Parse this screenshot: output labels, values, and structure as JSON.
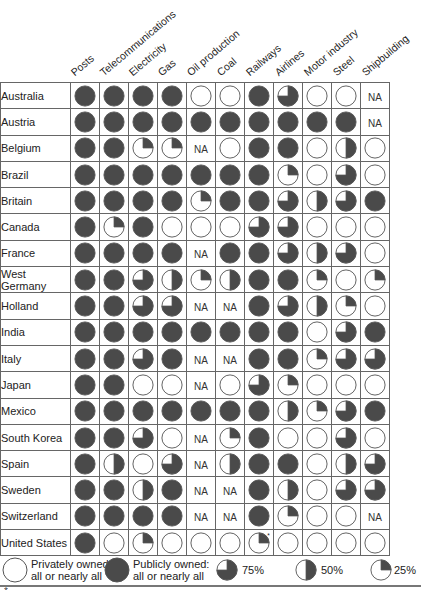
{
  "chart_data": {
    "type": "table",
    "title": "",
    "columns": [
      "Posts",
      "Telecommunications",
      "Electricity",
      "Gas",
      "Oil production",
      "Coal",
      "Railways",
      "Airlines",
      "Motor industry",
      "Steel",
      "Shipbuilding"
    ],
    "value_legend": {
      "0": "Privately owned: all or nearly all",
      "25": "25%",
      "50": "50%",
      "75": "75%",
      "100": "Publicly owned: all or nearly all",
      "NA": "NA"
    },
    "rows": [
      {
        "country": "Australia",
        "values": [
          100,
          100,
          100,
          100,
          0,
          0,
          100,
          75,
          0,
          0,
          "NA"
        ]
      },
      {
        "country": "Austria",
        "values": [
          100,
          100,
          100,
          100,
          100,
          100,
          100,
          100,
          100,
          100,
          "NA"
        ]
      },
      {
        "country": "Belgium",
        "values": [
          100,
          100,
          25,
          25,
          "NA",
          0,
          100,
          100,
          0,
          50,
          0
        ]
      },
      {
        "country": "Brazil",
        "values": [
          100,
          100,
          100,
          100,
          100,
          100,
          100,
          25,
          0,
          75,
          0
        ]
      },
      {
        "country": "Britain",
        "values": [
          100,
          100,
          100,
          100,
          25,
          100,
          100,
          75,
          50,
          75,
          100
        ]
      },
      {
        "country": "Canada",
        "values": [
          100,
          25,
          100,
          0,
          0,
          0,
          75,
          75,
          0,
          0,
          0
        ]
      },
      {
        "country": "France",
        "values": [
          100,
          100,
          100,
          100,
          "NA",
          100,
          100,
          75,
          50,
          75,
          0
        ]
      },
      {
        "country": "West Germany",
        "values": [
          100,
          100,
          75,
          50,
          25,
          50,
          100,
          100,
          25,
          0,
          25
        ]
      },
      {
        "country": "Holland",
        "values": [
          100,
          100,
          75,
          75,
          "NA",
          "NA",
          100,
          75,
          50,
          25,
          0
        ]
      },
      {
        "country": "India",
        "values": [
          100,
          100,
          100,
          100,
          100,
          100,
          100,
          100,
          0,
          75,
          100
        ]
      },
      {
        "country": "Italy",
        "values": [
          100,
          100,
          75,
          100,
          "NA",
          "NA",
          100,
          100,
          25,
          75,
          75
        ]
      },
      {
        "country": "Japan",
        "values": [
          100,
          100,
          0,
          0,
          "NA",
          0,
          75,
          25,
          0,
          0,
          0
        ]
      },
      {
        "country": "Mexico",
        "values": [
          100,
          100,
          100,
          100,
          100,
          100,
          100,
          50,
          25,
          75,
          100
        ]
      },
      {
        "country": "South Korea",
        "values": [
          100,
          100,
          75,
          0,
          "NA",
          25,
          100,
          0,
          0,
          75,
          0
        ]
      },
      {
        "country": "Spain",
        "values": [
          100,
          50,
          0,
          75,
          "NA",
          50,
          100,
          100,
          0,
          50,
          75
        ]
      },
      {
        "country": "Sweden",
        "values": [
          100,
          100,
          50,
          100,
          "NA",
          "NA",
          100,
          50,
          0,
          75,
          75
        ]
      },
      {
        "country": "Switzerland",
        "values": [
          100,
          100,
          100,
          100,
          "NA",
          "NA",
          100,
          25,
          0,
          0,
          "NA"
        ]
      },
      {
        "country": "United States",
        "values": [
          100,
          0,
          25,
          0,
          0,
          0,
          "25*",
          0,
          0,
          0,
          0
        ]
      }
    ]
  },
  "headers": [
    "Posts",
    "Telecommunications",
    "Electricity",
    "Gas",
    "Oil production",
    "Coal",
    "Railways",
    "Airlines",
    "Motor industry",
    "Steel",
    "Shipbuilding"
  ],
  "countries": [
    "Australia",
    "Austria",
    "Belgium",
    "Brazil",
    "Britain",
    "Canada",
    "France",
    "West Germany",
    "Holland",
    "India",
    "Italy",
    "Japan",
    "Mexico",
    "South Korea",
    "Spain",
    "Sweden",
    "Switzerland",
    "United States"
  ],
  "legend": {
    "private_line1": "Privately owned:",
    "private_line2": "all or nearly all",
    "public_line1": "Publicly owned:",
    "public_line2": "all or nearly all",
    "p75": "75%",
    "p50": "50%",
    "p25": "25%"
  },
  "na_label": "NA",
  "colors": {
    "fill": "#4a4a4a",
    "stroke": "#555555",
    "grid": "#666666"
  },
  "footnote": "*"
}
